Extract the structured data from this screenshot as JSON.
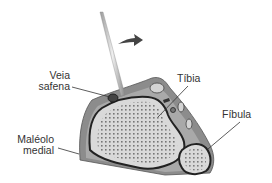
{
  "diagram": {
    "type": "anatomical cross-section",
    "labels": {
      "veia": "Veia",
      "safena": "safena",
      "tibia": "Tíbia",
      "fibula": "Fíbula",
      "maleolo": "Maléolo",
      "medial": "medial"
    },
    "colors": {
      "skin": "#8c8c8c",
      "skin_light": "#b5b5b5",
      "bone": "#d9d9d9",
      "bone_dots": "#555555",
      "outline": "#222222",
      "text": "#333333",
      "arrow": "#444444"
    }
  }
}
